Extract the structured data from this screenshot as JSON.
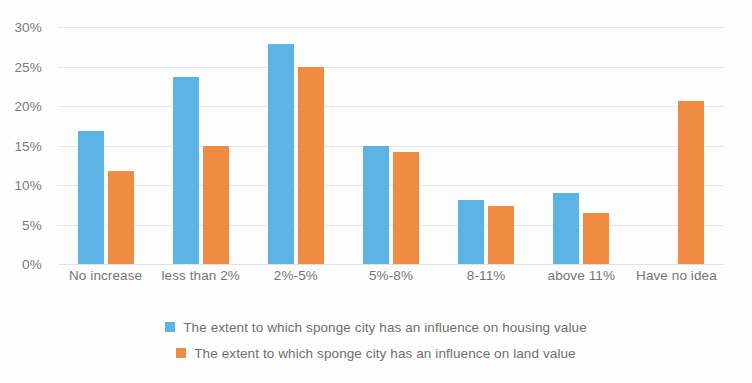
{
  "chart_data": {
    "type": "bar",
    "title": "",
    "subtitle": "",
    "xlabel": "",
    "ylabel": "",
    "ylim": [
      0,
      30
    ],
    "ytick_labels": [
      "0%",
      "5%",
      "10%",
      "15%",
      "20%",
      "25%",
      "30%"
    ],
    "ytick_values": [
      0,
      5,
      10,
      15,
      20,
      25,
      30
    ],
    "grid": true,
    "legend_position": "bottom",
    "categories": [
      "No increase",
      "less than 2%",
      "2%-5%",
      "5%-8%",
      "8-11%",
      "above 11%",
      "Have no idea"
    ],
    "series": [
      {
        "name": "The extent to which sponge city has an influence on housing value",
        "color": "#5cb3e4",
        "values": [
          16.8,
          23.7,
          27.8,
          15.0,
          8.1,
          9.0,
          0
        ]
      },
      {
        "name": "The extent to which sponge city has an influence on land value",
        "color": "#f08b43",
        "values": [
          11.8,
          15.0,
          24.9,
          14.2,
          7.4,
          6.4,
          20.6
        ]
      }
    ]
  },
  "legend": {
    "items": [
      {
        "label": "The extent to which sponge city has an influence on housing value",
        "swatch_name": "legend-swatch-housing-value",
        "color": "#5cb3e4"
      },
      {
        "label": "The extent to which sponge city has an influence on land value",
        "swatch_name": "legend-swatch-land-value",
        "color": "#f08b43"
      }
    ]
  }
}
